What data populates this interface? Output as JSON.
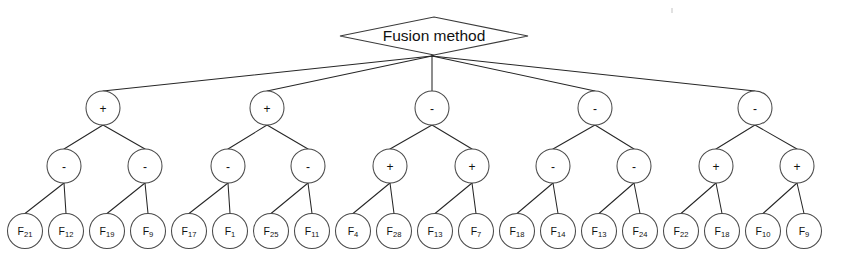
{
  "figure": {
    "background_color": "#ffffff",
    "line_color": "#262626",
    "node_stroke_color": "#4a4a4a",
    "node_fill_color": "#ffffff",
    "text_color": "#111111"
  },
  "root": {
    "label": "Fusion method",
    "shape": "diamond",
    "cx": 434,
    "cy": 36,
    "rx": 94,
    "ry": 19,
    "fan_x": 432,
    "fan_y": 56
  },
  "levels": {
    "level2_y": 108,
    "level3_y": 166,
    "leaf_y": 231,
    "op_radius": 17,
    "leaf_radius": 17.5
  },
  "level2": [
    {
      "label": "+",
      "cx": 103
    },
    {
      "label": "+",
      "cx": 267
    },
    {
      "label": "-",
      "cx": 432
    },
    {
      "label": "-",
      "cx": 595
    },
    {
      "label": "-",
      "cx": 755
    }
  ],
  "level3": [
    {
      "label": "-",
      "cx": 64,
      "parent": 0
    },
    {
      "label": "-",
      "cx": 145,
      "parent": 0
    },
    {
      "label": "-",
      "cx": 228,
      "parent": 1
    },
    {
      "label": "-",
      "cx": 308,
      "parent": 1
    },
    {
      "label": "+",
      "cx": 390,
      "parent": 2
    },
    {
      "label": "+",
      "cx": 472,
      "parent": 2
    },
    {
      "label": "-",
      "cx": 553,
      "parent": 3
    },
    {
      "label": "-",
      "cx": 634,
      "parent": 3
    },
    {
      "label": "+",
      "cx": 716,
      "parent": 4
    },
    {
      "label": "+",
      "cx": 797,
      "parent": 4
    }
  ],
  "leaves": [
    {
      "base": "F",
      "sub": "21",
      "label": "F21",
      "cx": 25,
      "parent": 0
    },
    {
      "base": "F",
      "sub": "12",
      "label": "F12",
      "cx": 66,
      "parent": 0
    },
    {
      "base": "F",
      "sub": "19",
      "label": "F19",
      "cx": 107,
      "parent": 1
    },
    {
      "base": "F",
      "sub": "9",
      "label": "F9",
      "cx": 148,
      "parent": 1
    },
    {
      "base": "F",
      "sub": "17",
      "label": "F17",
      "cx": 189,
      "parent": 2
    },
    {
      "base": "F",
      "sub": "1",
      "label": "F1",
      "cx": 230,
      "parent": 2
    },
    {
      "base": "F",
      "sub": "25",
      "label": "F25",
      "cx": 271,
      "parent": 3
    },
    {
      "base": "F",
      "sub": "11",
      "label": "F11",
      "cx": 312,
      "parent": 3
    },
    {
      "base": "F",
      "sub": "4",
      "label": "F4",
      "cx": 353,
      "parent": 4
    },
    {
      "base": "F",
      "sub": "28",
      "label": "F28",
      "cx": 394,
      "parent": 4
    },
    {
      "base": "F",
      "sub": "13",
      "label": "F13",
      "cx": 435,
      "parent": 5
    },
    {
      "base": "F",
      "sub": "7",
      "label": "F7",
      "cx": 476,
      "parent": 5
    },
    {
      "base": "F",
      "sub": "18",
      "label": "F18",
      "cx": 517,
      "parent": 6
    },
    {
      "base": "F",
      "sub": "14",
      "label": "F14",
      "cx": 558,
      "parent": 6
    },
    {
      "base": "F",
      "sub": "13",
      "label": "F13",
      "cx": 599,
      "parent": 7
    },
    {
      "base": "F",
      "sub": "24",
      "label": "F24",
      "cx": 640,
      "parent": 7
    },
    {
      "base": "F",
      "sub": "22",
      "label": "F22",
      "cx": 681,
      "parent": 8
    },
    {
      "base": "F",
      "sub": "18",
      "label": "F18",
      "cx": 722,
      "parent": 8
    },
    {
      "base": "F",
      "sub": "10",
      "label": "F10",
      "cx": 763,
      "parent": 9
    },
    {
      "base": "F",
      "sub": "9",
      "label": "F9",
      "cx": 804,
      "parent": 9
    }
  ]
}
